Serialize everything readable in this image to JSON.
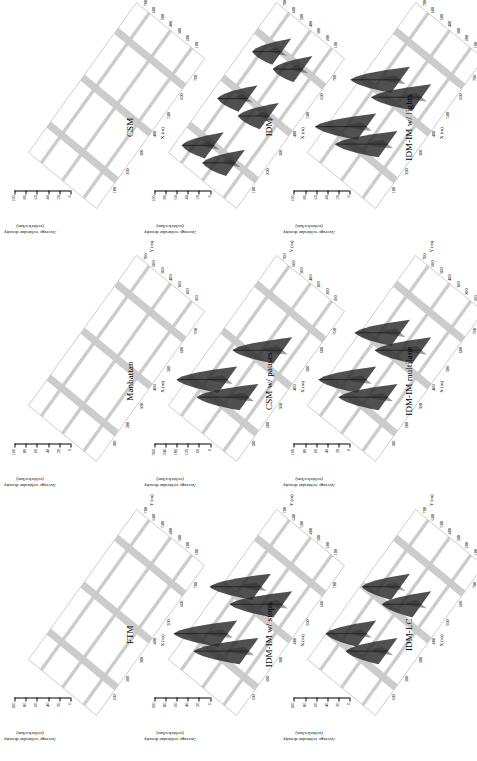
{
  "figure": {
    "orientation": "rotated-90-ccw",
    "rows": 3,
    "cols": 3,
    "zaxis_title_line1": "Average vehicular density",
    "zaxis_title_line2": "(vehicles/km)",
    "xaxis_label": "X (m)",
    "yaxis_label": "Y (m)",
    "x_ticks": [
      "100",
      "200",
      "300",
      "400",
      "500",
      "600",
      "700"
    ],
    "y_ticks": [
      "100",
      "200",
      "300",
      "400",
      "500",
      "600",
      "700"
    ],
    "z_ticks_default": [
      "0",
      "20",
      "40",
      "60",
      "80",
      "100"
    ],
    "z_ticks_pauses": [
      "0",
      "60",
      "120",
      "180",
      "240",
      "300"
    ],
    "road_color": "#c9c9c9",
    "peak_color": "#2a2a2a",
    "frame_color": "#9a9a9a"
  },
  "chart_data": {
    "type": "surface",
    "xlabel": "X (m)",
    "ylabel": "Y (m)",
    "zlabel": "Average vehicular density (vehicles/km)",
    "xlim": [
      0,
      800
    ],
    "ylim": [
      0,
      800
    ],
    "grid": false,
    "panels": [
      {
        "id": "ftm",
        "title": "FTM",
        "row": 1,
        "col": 1,
        "zlim": [
          0,
          100
        ],
        "z_ticks": [
          "0",
          "20",
          "40",
          "60",
          "80",
          "100"
        ],
        "peaks": [],
        "description": "Uniform low density along all road segments; no localized peaks.",
        "baseline_density": 8
      },
      {
        "id": "manhattan",
        "title": "Manhattan",
        "row": 1,
        "col": 2,
        "zlim": [
          0,
          100
        ],
        "z_ticks": [
          "0",
          "20",
          "40",
          "60",
          "80",
          "100"
        ],
        "peaks": [],
        "description": "Uniform low density along all road segments; no localized peaks.",
        "baseline_density": 8
      },
      {
        "id": "csm",
        "title": "CSM",
        "row": 1,
        "col": 3,
        "zlim": [
          0,
          100
        ],
        "z_ticks": [
          "0",
          "20",
          "40",
          "60",
          "80",
          "100"
        ],
        "peaks": [],
        "description": "Uniform low density along all road segments; no localized peaks.",
        "baseline_density": 8
      },
      {
        "id": "idm-im-stops",
        "title": "IDM-IM w/ stops",
        "row": 2,
        "col": 1,
        "zlim": [
          0,
          100
        ],
        "z_ticks": [
          "0",
          "20",
          "40",
          "60",
          "80",
          "100"
        ],
        "peaks": [
          {
            "x": 250,
            "y": 250,
            "z": 92
          },
          {
            "x": 500,
            "y": 250,
            "z": 88
          },
          {
            "x": 250,
            "y": 500,
            "z": 90
          },
          {
            "x": 500,
            "y": 500,
            "z": 86
          }
        ],
        "description": "Large dark density spikes at every intersection.",
        "baseline_density": 10
      },
      {
        "id": "csm-pauses",
        "title": "CSM w/ pauses",
        "row": 2,
        "col": 2,
        "zlim": [
          0,
          300
        ],
        "z_ticks": [
          "0",
          "60",
          "120",
          "180",
          "240",
          "300"
        ],
        "peaks": [
          {
            "x": 250,
            "y": 250,
            "z": 260
          },
          {
            "x": 500,
            "y": 250,
            "z": 250
          },
          {
            "x": 250,
            "y": 500,
            "z": 255
          }
        ],
        "description": "Very tall narrow spikes at a few intersections; z-axis scaled to 300.",
        "baseline_density": 12
      },
      {
        "id": "idm",
        "title": "IDM",
        "row": 2,
        "col": 3,
        "zlim": [
          0,
          100
        ],
        "z_ticks": [
          "0",
          "20",
          "40",
          "60",
          "80",
          "100"
        ],
        "peaks": [
          {
            "x": 150,
            "y": 250,
            "z": 55
          },
          {
            "x": 400,
            "y": 250,
            "z": 52
          },
          {
            "x": 650,
            "y": 250,
            "z": 50
          },
          {
            "x": 150,
            "y": 500,
            "z": 54
          },
          {
            "x": 400,
            "y": 500,
            "z": 51
          },
          {
            "x": 650,
            "y": 500,
            "z": 49
          }
        ],
        "description": "Moderate narrow spikes distributed along road segments.",
        "baseline_density": 10
      },
      {
        "id": "idm-lc",
        "title": "IDM-LC",
        "row": 3,
        "col": 1,
        "zlim": [
          0,
          100
        ],
        "z_ticks": [
          "0",
          "20",
          "40",
          "60",
          "80",
          "100"
        ],
        "peaks": [
          {
            "x": 250,
            "y": 250,
            "z": 70
          },
          {
            "x": 500,
            "y": 250,
            "z": 66
          },
          {
            "x": 250,
            "y": 500,
            "z": 68
          },
          {
            "x": 500,
            "y": 500,
            "z": 64
          }
        ],
        "description": "Medium dark spikes at intersections.",
        "baseline_density": 10
      },
      {
        "id": "idm-im-multilane",
        "title": "IDM-IM multilane",
        "row": 3,
        "col": 2,
        "zlim": [
          0,
          100
        ],
        "z_ticks": [
          "0",
          "20",
          "40",
          "60",
          "80",
          "100"
        ],
        "peaks": [
          {
            "x": 250,
            "y": 250,
            "z": 82
          },
          {
            "x": 500,
            "y": 250,
            "z": 78
          },
          {
            "x": 250,
            "y": 500,
            "z": 80
          },
          {
            "x": 500,
            "y": 500,
            "z": 76
          }
        ],
        "description": "Broad dark spikes at intersections.",
        "baseline_density": 11
      },
      {
        "id": "idm-im-lights",
        "title": "IDM-IM w/ lights",
        "row": 3,
        "col": 3,
        "zlim": [
          0,
          100
        ],
        "z_ticks": [
          "0",
          "20",
          "40",
          "60",
          "80",
          "100"
        ],
        "peaks": [
          {
            "x": 250,
            "y": 250,
            "z": 88
          },
          {
            "x": 500,
            "y": 250,
            "z": 84
          },
          {
            "x": 250,
            "y": 500,
            "z": 86
          },
          {
            "x": 500,
            "y": 500,
            "z": 83
          }
        ],
        "description": "Very dark broad congestion peaks at all signalized intersections.",
        "baseline_density": 11
      }
    ]
  }
}
